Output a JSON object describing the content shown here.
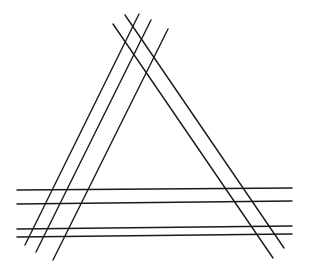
{
  "diagram": {
    "title": "",
    "stroke_color": "#1a1a1a",
    "background": "#ffffff",
    "lines": {
      "left_side": [
        {
          "x1": 25,
          "y1": 245,
          "x2": 139,
          "y2": 14
        },
        {
          "x1": 36,
          "y1": 252,
          "x2": 151,
          "y2": 20
        },
        {
          "x1": 53,
          "y1": 260,
          "x2": 168,
          "y2": 29
        }
      ],
      "right_side": [
        {
          "x1": 113,
          "y1": 24,
          "x2": 273,
          "y2": 258
        },
        {
          "x1": 125,
          "y1": 15,
          "x2": 284,
          "y2": 248
        }
      ],
      "base": [
        {
          "x1": 17,
          "y1": 190,
          "x2": 292,
          "y2": 188
        },
        {
          "x1": 17,
          "y1": 204,
          "x2": 292,
          "y2": 201
        },
        {
          "x1": 17,
          "y1": 229,
          "x2": 292,
          "y2": 226
        },
        {
          "x1": 17,
          "y1": 237,
          "x2": 292,
          "y2": 234
        }
      ]
    }
  }
}
